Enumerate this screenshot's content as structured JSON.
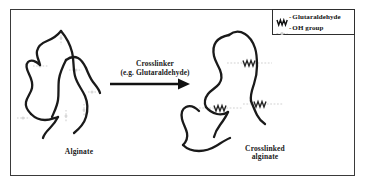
{
  "figure": {
    "background_color": "#ffffff",
    "frame_color": "#3a3a3a",
    "chain_color": "#1a1a1a",
    "oh_marker_color": "#cfcfcf",
    "crosslink_color": "#262626"
  },
  "left_structure": {
    "label": "Alginate",
    "name": "alginate-polymer-chain",
    "oh_group_count": 7
  },
  "right_structure": {
    "label": "Crosslinked\nalginate",
    "name": "crosslinked-alginate-chain",
    "crosslink_count": 3
  },
  "arrow": {
    "caption_line1": "Crosslinker",
    "caption_line2": "(e.g. Glutaraldehyde)",
    "direction": "right"
  },
  "legend": {
    "items": [
      {
        "glyph": "zigzag",
        "separator": "-",
        "label": "Glutaraldehyde"
      },
      {
        "glyph": "dotted-dash",
        "separator": "-",
        "label": "OH group"
      }
    ]
  }
}
